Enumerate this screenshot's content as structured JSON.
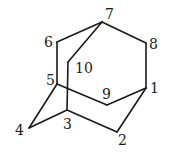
{
  "atoms": [
    {
      "id": "1",
      "label": "1"
    },
    {
      "id": "2",
      "label": "2"
    },
    {
      "id": "3",
      "label": "3"
    },
    {
      "id": "4",
      "label": "4"
    },
    {
      "id": "5",
      "label": "5"
    },
    {
      "id": "6",
      "label": "6"
    },
    {
      "id": "7",
      "label": "7"
    },
    {
      "id": "8",
      "label": "8"
    },
    {
      "id": "9",
      "label": "9"
    },
    {
      "id": "10",
      "label": "10"
    }
  ],
  "bonds": [
    [
      "7",
      "6"
    ],
    [
      "7",
      "8"
    ],
    [
      "7",
      "10"
    ],
    [
      "6",
      "5"
    ],
    [
      "10",
      "3"
    ],
    [
      "5",
      "9"
    ],
    [
      "5",
      "4"
    ],
    [
      "9",
      "1"
    ],
    [
      "8",
      "1"
    ],
    [
      "1",
      "2"
    ],
    [
      "2",
      "3"
    ],
    [
      "3",
      "4"
    ]
  ],
  "colors": {
    "line": "#1a1a1a",
    "background": "#ffffff"
  }
}
